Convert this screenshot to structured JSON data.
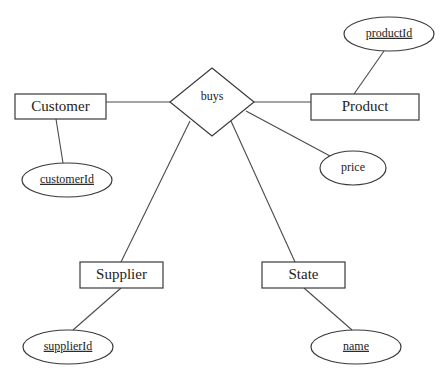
{
  "diagram": {
    "type": "er-diagram",
    "relationship": {
      "id": "buys",
      "label": "buys",
      "cx": 212,
      "cy": 102,
      "hw": 42,
      "hh": 34
    },
    "entities": [
      {
        "id": "customer",
        "label": "Customer",
        "x": 15,
        "y": 94,
        "w": 91,
        "h": 25
      },
      {
        "id": "product",
        "label": "Product",
        "x": 311,
        "y": 94,
        "w": 108,
        "h": 26
      },
      {
        "id": "supplier",
        "label": "Supplier",
        "x": 80,
        "y": 262,
        "w": 83,
        "h": 26
      },
      {
        "id": "state",
        "label": "State",
        "x": 262,
        "y": 262,
        "w": 83,
        "h": 26
      }
    ],
    "attributes": [
      {
        "id": "productId",
        "label": "productId",
        "key": true,
        "entity": "product",
        "cx": 389,
        "cy": 34,
        "rx": 45,
        "ry": 17
      },
      {
        "id": "customerId",
        "label": "customerId",
        "key": true,
        "entity": "customer",
        "cx": 67,
        "cy": 180,
        "rx": 45,
        "ry": 17
      },
      {
        "id": "price",
        "label": "price",
        "key": false,
        "entity": "buys",
        "cx": 353,
        "cy": 168,
        "rx": 33,
        "ry": 17
      },
      {
        "id": "supplierId",
        "label": "supplierId",
        "key": true,
        "entity": "supplier",
        "cx": 68,
        "cy": 347,
        "rx": 45,
        "ry": 17
      },
      {
        "id": "name",
        "label": "name",
        "key": true,
        "entity": "state",
        "cx": 356,
        "cy": 347,
        "rx": 45,
        "ry": 17
      }
    ],
    "edges": [
      {
        "from": "customer",
        "to": "buys",
        "x1": 106,
        "y1": 102,
        "x2": 171,
        "y2": 102
      },
      {
        "from": "buys",
        "to": "product",
        "x1": 254,
        "y1": 102,
        "x2": 311,
        "y2": 102
      },
      {
        "from": "buys",
        "to": "supplier",
        "x1": 190,
        "y1": 121,
        "x2": 121,
        "y2": 262
      },
      {
        "from": "buys",
        "to": "state",
        "x1": 231,
        "y1": 121,
        "x2": 295,
        "y2": 262
      },
      {
        "from": "buys",
        "to": "price",
        "x1": 246,
        "y1": 111,
        "x2": 330,
        "y2": 156
      },
      {
        "from": "product",
        "to": "productId",
        "x1": 354,
        "y1": 94,
        "x2": 384,
        "y2": 51
      },
      {
        "from": "customer",
        "to": "customerId",
        "x1": 56,
        "y1": 119,
        "x2": 63,
        "y2": 163
      },
      {
        "from": "supplier",
        "to": "supplierId",
        "x1": 121,
        "y1": 288,
        "x2": 73,
        "y2": 330
      },
      {
        "from": "state",
        "to": "name",
        "x1": 304,
        "y1": 288,
        "x2": 352,
        "y2": 330
      }
    ]
  }
}
